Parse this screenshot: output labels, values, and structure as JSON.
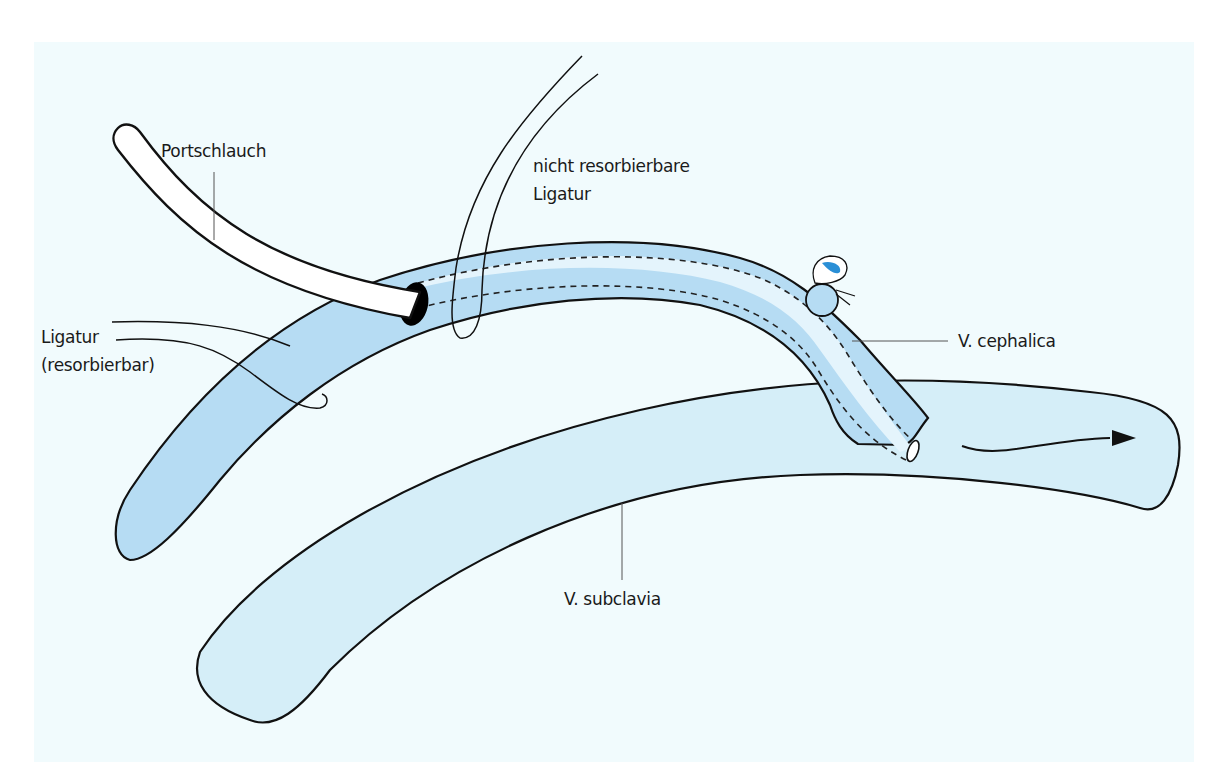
{
  "diagram": {
    "colors": {
      "background": "#f1fbfd",
      "v_cephalica_fill": "#b6dcf3",
      "v_cephalica_lumen": "#dff2fb",
      "v_subclavia_fill": "#d5eef8",
      "catheter_fill": "#ffffff",
      "outline": "#111111",
      "knot_accent": "#2a8fd6"
    },
    "labels": {
      "portschlauch": "Portschlauch",
      "nicht_resorbierbare_line1": "nicht resorbierbare",
      "nicht_resorbierbare_line2": "Ligatur",
      "ligatur_line1": "Ligatur",
      "ligatur_line2": "(resorbierbar)",
      "v_cephalica": "V. cephalica",
      "v_subclavia": "V. subclavia"
    },
    "elements": [
      {
        "name": "Portschlauch",
        "description": "white catheter tube entering the cephalic vein"
      },
      {
        "name": "nicht resorbierbare Ligatur",
        "description": "non-absorbable ligature tied around vein and catheter"
      },
      {
        "name": "Ligatur (resorbierbar)",
        "description": "absorbable ligature around proximal vein"
      },
      {
        "name": "V. cephalica",
        "description": "cephalic vein, darker blue, with catheter shown dashed inside"
      },
      {
        "name": "V. subclavia",
        "description": "subclavian vein, lighter blue, catheter tip opens inside"
      },
      {
        "name": "flow-arrow",
        "description": "arrow indicating blood flow direction to the right"
      }
    ]
  }
}
